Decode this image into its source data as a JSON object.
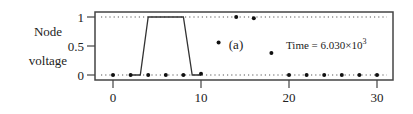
{
  "chart_data": {
    "type": "scatter",
    "title": "",
    "panel_label": "(a)",
    "annotation": "Time = 6.030×10³",
    "annotation_parts": {
      "prefix": "Time = 6.030×10",
      "exponent": "3"
    },
    "ylabel_lines": [
      "Node",
      "voltage"
    ],
    "xlabel": "",
    "xlim": [
      -1.5,
      32
    ],
    "ylim": [
      -0.08,
      1.08
    ],
    "x_ticks": [
      0,
      10,
      20,
      30
    ],
    "x_tick_labels": [
      "0",
      "10",
      "20",
      "30"
    ],
    "y_ticks": [
      0,
      0.5,
      1
    ],
    "y_tick_labels": [
      "0",
      "0.5",
      "1"
    ],
    "reference_lines": [
      0,
      1
    ],
    "series": [
      {
        "name": "node voltages (dots)",
        "style": "points",
        "x": [
          0,
          2,
          4,
          6,
          8,
          10,
          12,
          14,
          16,
          18,
          20,
          22,
          24,
          26,
          28,
          30
        ],
        "y": [
          0,
          0,
          0,
          0,
          0,
          0.02,
          0.56,
          1.0,
          0.98,
          0.38,
          0,
          0,
          0,
          0,
          0,
          0
        ]
      },
      {
        "name": "pulse (line)",
        "style": "line",
        "x": [
          2,
          3.1,
          4.0,
          8.0,
          9.0,
          10
        ],
        "y": [
          0,
          0,
          1,
          1,
          0,
          0
        ]
      }
    ]
  }
}
